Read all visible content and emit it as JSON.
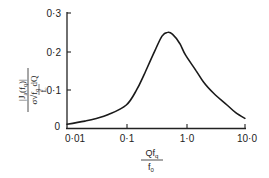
{
  "chart_data": {
    "type": "line",
    "title": "",
    "xlabel": "Qf_q / f_0",
    "ylabel": "|J_a(f_q)| / (σ √(f_q/f_c) dQ)",
    "xscale": "log",
    "xlim": [
      0.01,
      10.0
    ],
    "ylim": [
      0,
      0.3
    ],
    "grid": false,
    "legend": null,
    "x_ticks": [
      "0·01",
      "0·1",
      "1·0",
      "10·0"
    ],
    "y_ticks": [
      "0",
      "0·1",
      "0·2",
      "0·3"
    ],
    "series": [
      {
        "name": "response",
        "x": [
          0.01,
          0.02,
          0.03,
          0.05,
          0.1,
          0.15,
          0.2,
          0.3,
          0.4,
          0.5,
          0.6,
          0.8,
          1.0,
          1.5,
          2.0,
          3.0,
          5.0,
          7.0,
          10.0
        ],
        "y": [
          0.01,
          0.018,
          0.024,
          0.035,
          0.06,
          0.1,
          0.14,
          0.2,
          0.24,
          0.25,
          0.245,
          0.22,
          0.19,
          0.15,
          0.12,
          0.09,
          0.06,
          0.04,
          0.025
        ]
      }
    ]
  },
  "axes": {
    "y_tick_labels": [
      "0",
      "0·1",
      "0·2",
      "0·3"
    ],
    "x_tick_labels": [
      "0·01",
      "0·1",
      "1·0",
      "10·0"
    ],
    "origin_label": "0",
    "ylabel": {
      "numerator": "|J",
      "numerator_sub": "a",
      "numerator_tail": "(f",
      "numerator_tail_sub": "q",
      "numerator_end": ")|",
      "denominator": "σ√f",
      "denominator_sub": "q",
      "denominator_tail": " dQ",
      "denominator_under": "f",
      "denominator_under_sub": "c"
    },
    "xlabel": {
      "numerator": "Qf",
      "numerator_sub": "q",
      "denominator": "f",
      "denominator_sub": "0"
    }
  }
}
